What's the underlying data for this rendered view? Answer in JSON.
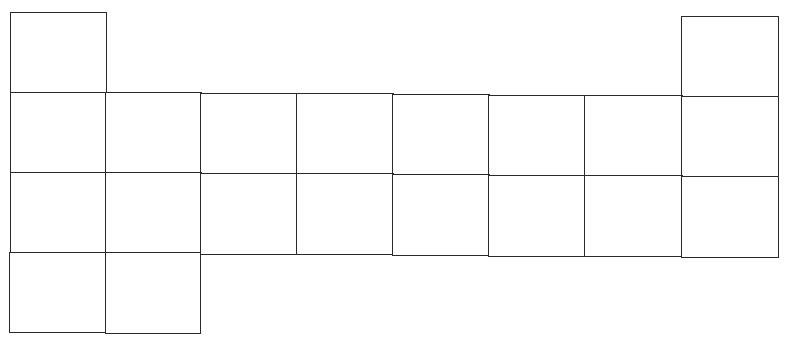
{
  "diagram": {
    "line_color": "#2a2a2a",
    "background": "#ffffff",
    "columns": 8,
    "rows": 4,
    "cells": [
      {
        "row": 1,
        "col": 1,
        "x": 10,
        "y": 12,
        "w": 96,
        "h": 81
      },
      {
        "row": 1,
        "col": 8,
        "x": 681,
        "y": 16,
        "w": 97,
        "h": 81
      },
      {
        "row": 2,
        "col": 1,
        "x": 10,
        "y": 92,
        "w": 96,
        "h": 81
      },
      {
        "row": 2,
        "col": 2,
        "x": 105,
        "y": 92,
        "w": 96,
        "h": 81
      },
      {
        "row": 2,
        "col": 3,
        "x": 200,
        "y": 93,
        "w": 97,
        "h": 81
      },
      {
        "row": 2,
        "col": 4,
        "x": 296,
        "y": 93,
        "w": 97,
        "h": 81
      },
      {
        "row": 2,
        "col": 5,
        "x": 392,
        "y": 94,
        "w": 97,
        "h": 81
      },
      {
        "row": 2,
        "col": 6,
        "x": 488,
        "y": 95,
        "w": 97,
        "h": 81
      },
      {
        "row": 2,
        "col": 7,
        "x": 584,
        "y": 95,
        "w": 98,
        "h": 81
      },
      {
        "row": 2,
        "col": 8,
        "x": 681,
        "y": 96,
        "w": 97,
        "h": 81
      },
      {
        "row": 3,
        "col": 1,
        "x": 10,
        "y": 172,
        "w": 96,
        "h": 81
      },
      {
        "row": 3,
        "col": 2,
        "x": 105,
        "y": 172,
        "w": 96,
        "h": 81
      },
      {
        "row": 3,
        "col": 3,
        "x": 200,
        "y": 173,
        "w": 97,
        "h": 81
      },
      {
        "row": 3,
        "col": 4,
        "x": 296,
        "y": 173,
        "w": 97,
        "h": 81
      },
      {
        "row": 3,
        "col": 5,
        "x": 392,
        "y": 174,
        "w": 97,
        "h": 81
      },
      {
        "row": 3,
        "col": 6,
        "x": 488,
        "y": 175,
        "w": 97,
        "h": 81
      },
      {
        "row": 3,
        "col": 7,
        "x": 584,
        "y": 175,
        "w": 98,
        "h": 81
      },
      {
        "row": 3,
        "col": 8,
        "x": 681,
        "y": 176,
        "w": 97,
        "h": 81
      },
      {
        "row": 4,
        "col": 1,
        "x": 9,
        "y": 252,
        "w": 97,
        "h": 80
      },
      {
        "row": 4,
        "col": 2,
        "x": 105,
        "y": 252,
        "w": 95,
        "h": 81
      }
    ]
  }
}
